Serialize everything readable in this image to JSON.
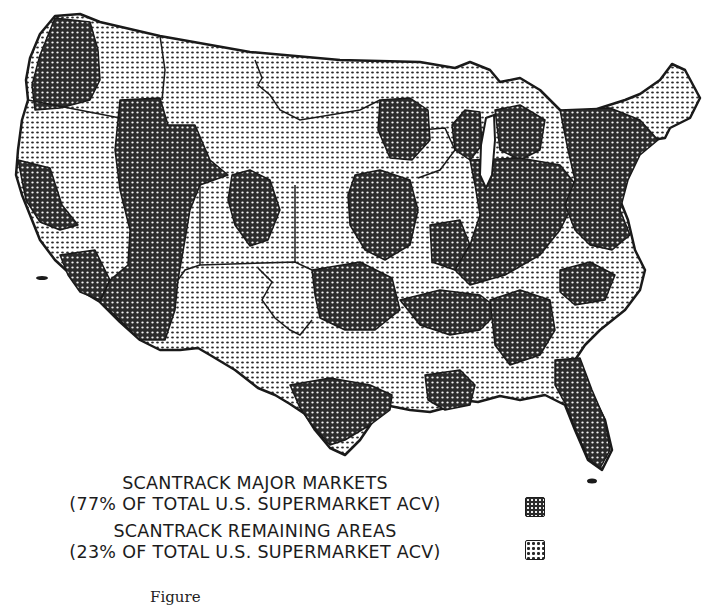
{
  "map": {
    "title": "Scantrack Markets — Contiguous United States",
    "region_categories": [
      {
        "id": "major",
        "label": "SCANTRACK MAJOR MARKETS",
        "share_label": "(77% OF TOTAL U.S. SUPERMARKET ACV)",
        "share_pct": 77,
        "fill": "#3a3a3a",
        "pattern": "dense-dark"
      },
      {
        "id": "remaining",
        "label": "SCANTRACK REMAINING AREAS",
        "share_label": "(23% OF TOTAL U.S. SUPERMARKET ACV)",
        "share_pct": 23,
        "fill": "#d8d8d8",
        "pattern": "light-dots"
      }
    ],
    "colors": {
      "outline": "#1a1a1a",
      "background": "#ffffff",
      "dark_pattern": "#2b2b2b",
      "light_pattern": "#bdbdbd"
    }
  },
  "legend": {
    "major_label": "SCANTRACK MAJOR MARKETS",
    "major_share": "(77% OF TOTAL U.S. SUPERMARKET ACV)",
    "remaining_label": "SCANTRACK REMAINING AREAS",
    "remaining_share": "(23% OF TOTAL U.S. SUPERMARKET ACV)"
  },
  "caption": {
    "text": "Figure"
  }
}
